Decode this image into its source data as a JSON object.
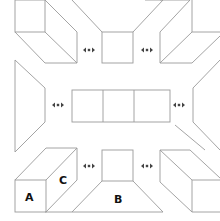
{
  "diagram": {
    "labels": {
      "a": "A",
      "b": "B",
      "c": "C"
    },
    "arrow_icon": "double-headed-horizontal-arrow",
    "colors": {
      "stroke": "#9a9a9a",
      "label": "#111111",
      "background": "#ffffff"
    },
    "arrow_positions": [
      {
        "x": 89,
        "y": 50
      },
      {
        "x": 147,
        "y": 50
      },
      {
        "x": 58,
        "y": 105
      },
      {
        "x": 179,
        "y": 105
      },
      {
        "x": 89,
        "y": 166
      },
      {
        "x": 147,
        "y": 166
      }
    ]
  }
}
